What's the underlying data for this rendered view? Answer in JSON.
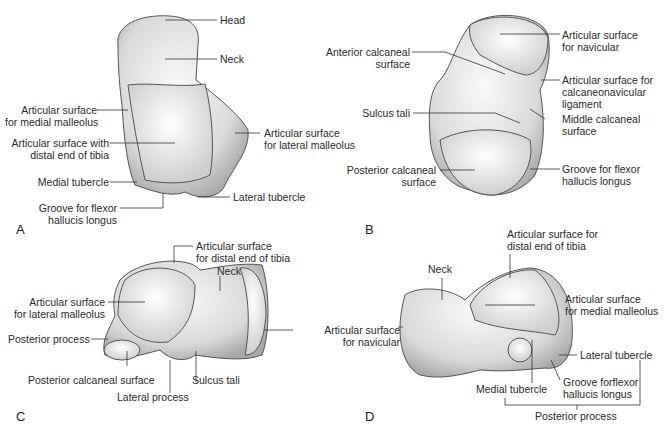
{
  "panels": [
    {
      "letter": "A",
      "labels": [
        "Head",
        "Neck",
        "Articular surface\nfor medial malleolus",
        "Articular surface with\ndistal end of tibia",
        "Articular surface\nfor lateral malleolus",
        "Medial tubercle",
        "Lateral tubercle",
        "Groove for flexor\nhallucis longus"
      ]
    },
    {
      "letter": "B",
      "labels": [
        "Articular surface\nfor navicular",
        "Anterior calcaneal\nsurface",
        "Articular surface for\ncalcaneonavicular\nligament",
        "Sulcus tali",
        "Middle calcaneal\nsurface",
        "Posterior calcaneal\nsurface",
        "Groove for flexor\nhallucis longus"
      ]
    },
    {
      "letter": "C",
      "labels": [
        "Articular surface\nfor distal end of tibia",
        "Neck",
        "Articular surface\nfor lateral malleolus",
        "Articular surface\nfor navicular",
        "Posterior process",
        "Posterior calcaneal surface",
        "Sulcus tali",
        "Lateral process"
      ]
    },
    {
      "letter": "D",
      "labels": [
        "Articular surface for\ndistal end of tibia",
        "Neck",
        "Articular surface\nfor medial malleolus",
        "Lateral tubercle",
        "Medial tubercle",
        "Groove forflexor\nhallucis longus",
        "Posterior process"
      ]
    }
  ]
}
